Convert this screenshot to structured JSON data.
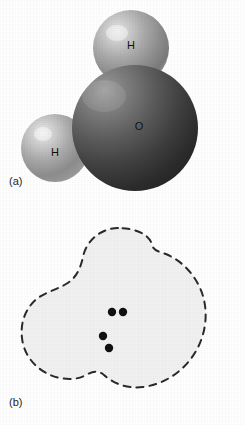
{
  "figure": {
    "caption_a": "(a)",
    "caption_b": "(b)",
    "background_color": "#ffffff"
  },
  "panel_a": {
    "name": "space-filling-model-of-water",
    "atoms": [
      {
        "element": "H",
        "label": "H",
        "position": "top",
        "color": "#9a9a9a"
      },
      {
        "element": "H",
        "label": "H",
        "position": "lower-left",
        "color": "#9a9a9a"
      },
      {
        "element": "O",
        "label": "O",
        "position": "center-right",
        "color": "#4a4a4a"
      }
    ],
    "label_h_top": "H",
    "label_h_left": "H",
    "label_o": "O"
  },
  "panel_b": {
    "name": "electron-cloud-polarity-diagram-of-water",
    "label_h_top": "H",
    "label_h_left": "H",
    "label_o": "O",
    "delta_positive": "δ+",
    "delta_negative": "δ−",
    "outline_style": "dashed",
    "fill_color": "#f2f2f2",
    "outline_color": "#2b2b2b",
    "lone_pair_dots": [
      {
        "x": 112,
        "y": 312
      },
      {
        "x": 123,
        "y": 312
      },
      {
        "x": 103,
        "y": 336
      },
      {
        "x": 109,
        "y": 348
      }
    ]
  }
}
